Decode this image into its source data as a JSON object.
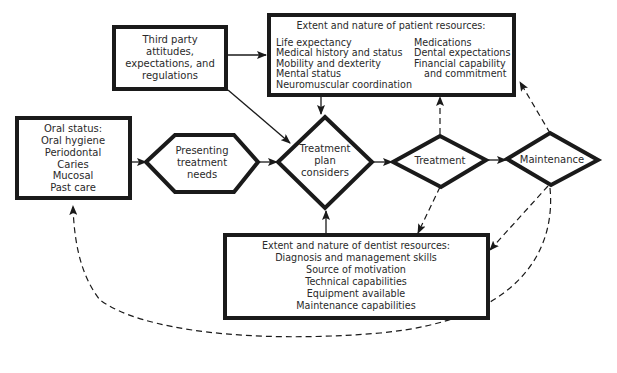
{
  "diagram": {
    "type": "flowchart",
    "nodes": {
      "third_party": {
        "lines": [
          "Third party",
          "attitudes,",
          "expectations, and",
          "regulations"
        ]
      },
      "patient_resources": {
        "title": "Extent and nature of patient resources:",
        "left": [
          "Life expectancy",
          "Medical history and status",
          "Mobility and dexterity",
          "Mental status",
          "Neuromuscular coordination"
        ],
        "right": [
          "Medications",
          "Dental expectations",
          "Financial capability",
          "and commitment"
        ]
      },
      "oral_status": {
        "lines": [
          "Oral status:",
          "Oral hygiene",
          "Periodontal",
          "Caries",
          "Mucosal",
          "Past care"
        ]
      },
      "presenting": {
        "lines": [
          "Presenting",
          "treatment",
          "needs"
        ]
      },
      "treatment_plan": {
        "lines": [
          "Treatment",
          "plan",
          "considers"
        ]
      },
      "treatment": {
        "label": "Treatment"
      },
      "maintenance": {
        "label": "Maintenance"
      },
      "dentist_resources": {
        "lines": [
          "Extent and nature of dentist resources:",
          "Diagnosis and management skills",
          "Source of motivation",
          "Technical capabilities",
          "Equipment available",
          "Maintenance capabilities"
        ]
      }
    },
    "edges": [
      {
        "from": "third_party",
        "to": "patient_resources",
        "style": "solid"
      },
      {
        "from": "third_party",
        "to": "treatment_plan",
        "style": "solid"
      },
      {
        "from": "oral_status",
        "to": "presenting",
        "style": "solid"
      },
      {
        "from": "presenting",
        "to": "treatment_plan",
        "style": "solid"
      },
      {
        "from": "patient_resources",
        "to": "treatment_plan",
        "style": "solid"
      },
      {
        "from": "dentist_resources",
        "to": "treatment_plan",
        "style": "solid"
      },
      {
        "from": "treatment_plan",
        "to": "treatment",
        "style": "solid"
      },
      {
        "from": "treatment",
        "to": "maintenance",
        "style": "solid"
      },
      {
        "from": "treatment",
        "to": "patient_resources",
        "style": "dashed"
      },
      {
        "from": "treatment",
        "to": "dentist_resources",
        "style": "dashed"
      },
      {
        "from": "maintenance",
        "to": "patient_resources",
        "style": "dashed"
      },
      {
        "from": "maintenance",
        "to": "dentist_resources",
        "style": "dashed"
      },
      {
        "from": "maintenance",
        "to": "oral_status",
        "style": "dashed"
      }
    ]
  }
}
